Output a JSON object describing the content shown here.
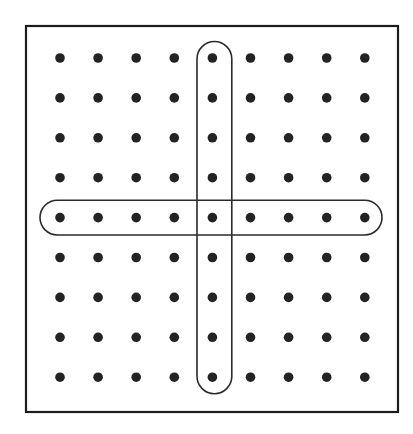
{
  "figure": {
    "name": "rectangular-array-with-highlighted-row-and-column",
    "background_color": "#ffffff"
  },
  "frame": {
    "name": "outer-square-border",
    "x": 26,
    "y": 26,
    "width": 372,
    "height": 386,
    "stroke_color": "#1c1c1c",
    "stroke_width": 2.2,
    "fill": "#ffffff"
  },
  "grid": {
    "rows": 9,
    "columns": 9,
    "total_dots": 81,
    "dot_color": "#232323",
    "dot_radius": 4.8,
    "origin_x": 60,
    "origin_y": 58,
    "step_x": 38.1,
    "step_y": 39.9,
    "column_centers_x": [
      60,
      98.1,
      136.2,
      174.3,
      212.4,
      250.5,
      288.6,
      326.7,
      364.8
    ],
    "row_centers_y": [
      58,
      97.9,
      137.8,
      177.7,
      217.6,
      257.5,
      297.4,
      337.3,
      377.2
    ]
  },
  "highlights": [
    {
      "name": "highlighted-row-ring",
      "orientation": "horizontal",
      "row_index": 5,
      "dots_enclosed": 9,
      "x": 40,
      "y": 200.2,
      "width": 342,
      "height": 34.8,
      "corner_radius": 17.4,
      "stroke_color": "#2a2a2a",
      "stroke_width": 1.6
    },
    {
      "name": "highlighted-column-ring",
      "orientation": "vertical",
      "column_index": 5,
      "dots_enclosed": 9,
      "x": 197,
      "y": 41.5,
      "width": 34.8,
      "height": 352.2,
      "corner_radius": 17.4,
      "stroke_color": "#2a2a2a",
      "stroke_width": 1.6
    }
  ],
  "chart_data": {
    "type": "scatter",
    "title": "",
    "subtitle": "",
    "xlabel": "",
    "ylabel": "",
    "grid": false,
    "legend_position": "none",
    "xlim": [
      0,
      10
    ],
    "ylim": [
      0,
      10
    ],
    "xticklabels": [],
    "yticklabels": [],
    "annotations": [
      "Rounded outline around row 5 (all 9 dots)",
      "Rounded outline around column 5 (all 9 dots)"
    ],
    "series": [
      {
        "name": "array-dots",
        "marker": "filled-circle",
        "color": "#232323",
        "x": [
          1,
          2,
          3,
          4,
          5,
          6,
          7,
          8,
          9,
          1,
          2,
          3,
          4,
          5,
          6,
          7,
          8,
          9,
          1,
          2,
          3,
          4,
          5,
          6,
          7,
          8,
          9,
          1,
          2,
          3,
          4,
          5,
          6,
          7,
          8,
          9,
          1,
          2,
          3,
          4,
          5,
          6,
          7,
          8,
          9,
          1,
          2,
          3,
          4,
          5,
          6,
          7,
          8,
          9,
          1,
          2,
          3,
          4,
          5,
          6,
          7,
          8,
          9,
          1,
          2,
          3,
          4,
          5,
          6,
          7,
          8,
          9,
          1,
          2,
          3,
          4,
          5,
          6,
          7,
          8,
          9
        ],
        "y": [
          9,
          9,
          9,
          9,
          9,
          9,
          9,
          9,
          9,
          8,
          8,
          8,
          8,
          8,
          8,
          8,
          8,
          8,
          7,
          7,
          7,
          7,
          7,
          7,
          7,
          7,
          7,
          6,
          6,
          6,
          6,
          6,
          6,
          6,
          6,
          6,
          5,
          5,
          5,
          5,
          5,
          5,
          5,
          5,
          5,
          4,
          4,
          4,
          4,
          4,
          4,
          4,
          4,
          4,
          3,
          3,
          3,
          3,
          3,
          3,
          3,
          3,
          3,
          2,
          2,
          2,
          2,
          2,
          2,
          2,
          2,
          2,
          1,
          1,
          1,
          1,
          1,
          1,
          1,
          1,
          1
        ]
      }
    ]
  }
}
